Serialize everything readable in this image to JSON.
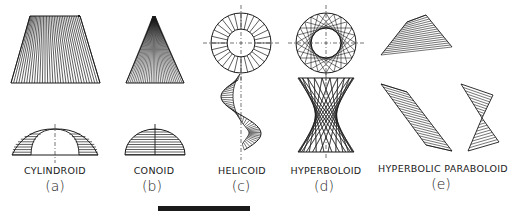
{
  "figure": {
    "surfaces": [
      {
        "id": "a",
        "name": "CYLINDROID",
        "sub": "(a)",
        "label_x": 55,
        "sub_x": 55
      },
      {
        "id": "b",
        "name": "CONOID",
        "sub": "(b)",
        "label_x": 154,
        "sub_x": 152
      },
      {
        "id": "c",
        "name": "HELICOID",
        "sub": "(c)",
        "label_x": 242,
        "sub_x": 241
      },
      {
        "id": "d",
        "name": "HYPERBOLOID",
        "sub": "(d)",
        "label_x": 326,
        "sub_x": 324
      },
      {
        "id": "e",
        "name": "HYPERBOLIC PARABOLOID",
        "sub": "(e)",
        "label_x": 442,
        "sub_x": 441
      }
    ],
    "line_color": "#1a1a1a",
    "background": "#ffffff"
  }
}
